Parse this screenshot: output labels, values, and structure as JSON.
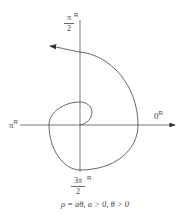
{
  "diagram": {
    "type": "polar-spiral",
    "axes": {
      "top_label": {
        "num": "π",
        "den": "2",
        "sup": "R"
      },
      "left_label": {
        "text": "π",
        "sup": "R"
      },
      "right_label": {
        "text": "0",
        "sup": "R"
      },
      "bottom_label": {
        "num": "3π",
        "den": "2",
        "sup": "R"
      }
    },
    "caption": "ρ = aθ,  a > 0,  θ > 0",
    "colors": {
      "line": "#555555",
      "text": "#444444"
    }
  }
}
